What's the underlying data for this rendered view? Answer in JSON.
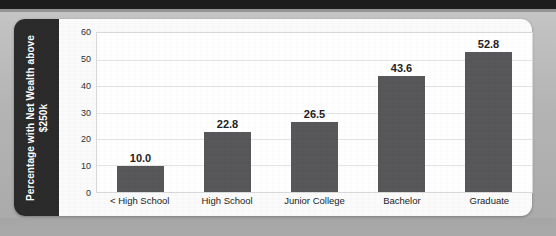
{
  "chart_data": {
    "type": "bar",
    "title": "",
    "xlabel": "",
    "ylabel": "Percentage with Net Wealth above $250k",
    "ylabel_line1": "Percentage with Net Wealth above",
    "ylabel_line2": "$250k",
    "categories": [
      "< High School",
      "High School",
      "Junior College",
      "Bachelor",
      "Graduate"
    ],
    "values": [
      10.0,
      22.8,
      26.5,
      43.6,
      52.8
    ],
    "value_labels": [
      "10.0",
      "22.8",
      "26.5",
      "43.6",
      "52.8"
    ],
    "ylim": [
      0,
      60
    ],
    "yticks": [
      0,
      10,
      20,
      30,
      40,
      50,
      60
    ],
    "ytick_labels": [
      "0",
      "10",
      "20",
      "30",
      "40",
      "50",
      "60"
    ],
    "grid": true,
    "grid_axis": "y",
    "legend": false,
    "legend_position": "none",
    "bar_color": "#58585a",
    "plot_background": "#ffffff",
    "gridline_color": "#e4e4e4",
    "axis_title_band_color": "#2b2b2b",
    "axis_title_text_color": "#ffffff",
    "card_background": "#fbfbfb",
    "page_background": "#b9b9b9"
  }
}
